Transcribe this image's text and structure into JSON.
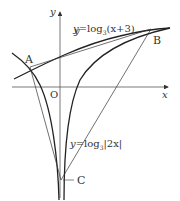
{
  "diagram": {
    "axes": {
      "x_label": "x",
      "y_label": "y",
      "origin_label": "O"
    },
    "curves": [
      {
        "id": "curve1",
        "label_prefix": "y=log",
        "label_base": "3",
        "label_arg": "(x+3)",
        "function": "log3(x+3)"
      },
      {
        "id": "curve2",
        "label_prefix": "y=log",
        "label_base": "3",
        "label_arg": "|2x|",
        "function": "log3|2x|"
      }
    ],
    "points": [
      {
        "label": "A"
      },
      {
        "label": "B"
      },
      {
        "label": "C"
      }
    ],
    "segments": [
      "AB",
      "AC",
      "BC"
    ]
  }
}
